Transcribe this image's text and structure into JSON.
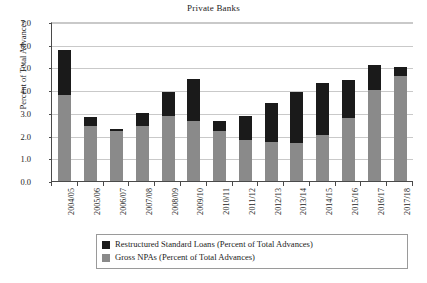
{
  "chart_data": {
    "type": "bar",
    "stacked": true,
    "title": "Private Banks",
    "xlabel": "",
    "ylabel": "Percent of Total Advances",
    "ylim": [
      0.0,
      7.0
    ],
    "ytick_step": 1.0,
    "ytick_labels": [
      "0.0",
      "1.0",
      "2.0",
      "3.0",
      "4.0",
      "5.0",
      "6.0",
      "7.0"
    ],
    "ytick_values": [
      0.0,
      1.0,
      2.0,
      3.0,
      4.0,
      5.0,
      6.0,
      7.0
    ],
    "grid": "horizontal",
    "legend_position": "bottom",
    "categories": [
      "2004/05",
      "2005/06",
      "2006/07",
      "2007/08",
      "2008/09",
      "2009/10",
      "2010/11",
      "2011/12",
      "2012/13",
      "2013/14",
      "2014/15",
      "2015/16",
      "2016/17",
      "2017/18"
    ],
    "series": [
      {
        "name": "Gross NPAs (Percent of Total Advances)",
        "color": "#8a8a8a",
        "values": [
          3.85,
          2.45,
          2.25,
          2.45,
          2.9,
          2.7,
          2.25,
          1.85,
          1.75,
          1.7,
          2.05,
          2.8,
          4.05,
          4.65
        ]
      },
      {
        "name": "Restructured Standard Loans (Percent of Total Advances)",
        "color": "#1a1a1a",
        "values": [
          1.95,
          0.4,
          0.1,
          0.6,
          1.05,
          1.85,
          0.45,
          1.05,
          1.75,
          2.25,
          2.3,
          1.7,
          1.1,
          0.4
        ]
      }
    ],
    "totals": [
      5.8,
      2.85,
      2.35,
      3.05,
      3.95,
      4.55,
      2.7,
      2.9,
      3.5,
      3.95,
      4.35,
      4.5,
      5.15,
      5.05
    ]
  },
  "legend": {
    "items": [
      {
        "label": "Restructured Standard Loans (Percent of Total Advances)",
        "swatch": "#1a1a1a"
      },
      {
        "label": "Gross NPAs (Percent of Total Advances)",
        "swatch": "#8a8a8a"
      }
    ]
  }
}
